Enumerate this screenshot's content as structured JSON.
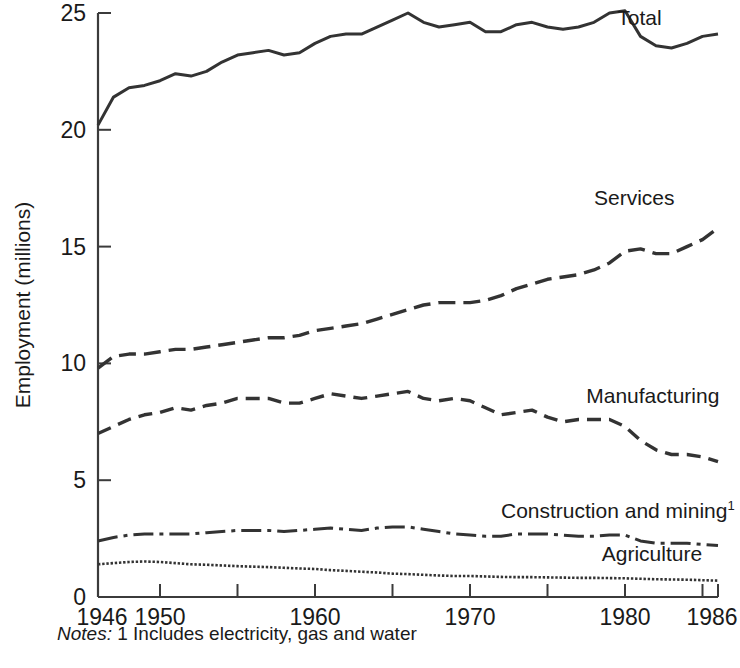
{
  "chart_data": {
    "type": "line",
    "title": "",
    "xlabel": "",
    "ylabel": "Employment (millions)",
    "xlim": [
      1946,
      1986
    ],
    "ylim": [
      0,
      25
    ],
    "grid": false,
    "legend_position": "inline-right-of-lines",
    "y_ticks": [
      "0",
      "5",
      "10",
      "15",
      "20",
      "25"
    ],
    "y_tick_values": [
      0,
      5,
      10,
      15,
      20,
      25
    ],
    "x_ticks": [
      "1946",
      "1950",
      "1960",
      "1970",
      "1980",
      "1986"
    ],
    "x_tick_values": [
      1946,
      1950,
      1960,
      1970,
      1980,
      1986
    ],
    "x_minor_tick_values": [
      1950,
      1955,
      1960,
      1965,
      1970,
      1975,
      1980,
      1985,
      1986
    ],
    "x": [
      1946,
      1947,
      1948,
      1949,
      1950,
      1951,
      1952,
      1953,
      1954,
      1955,
      1956,
      1957,
      1958,
      1959,
      1960,
      1961,
      1962,
      1963,
      1964,
      1965,
      1966,
      1967,
      1968,
      1969,
      1970,
      1971,
      1972,
      1973,
      1974,
      1975,
      1976,
      1977,
      1978,
      1979,
      1980,
      1981,
      1982,
      1983,
      1984,
      1985,
      1986
    ],
    "series": [
      {
        "name": "Total",
        "label": "Total",
        "style": "solid",
        "values": [
          20.2,
          21.4,
          21.8,
          21.9,
          22.1,
          22.4,
          22.3,
          22.5,
          22.9,
          23.2,
          23.3,
          23.4,
          23.2,
          23.3,
          23.7,
          24.0,
          24.1,
          24.1,
          24.4,
          24.7,
          25.0,
          24.6,
          24.4,
          24.5,
          24.6,
          24.2,
          24.2,
          24.5,
          24.6,
          24.4,
          24.3,
          24.4,
          24.6,
          25.0,
          25.1,
          24.0,
          23.6,
          23.5,
          23.7,
          24.0,
          24.1
        ]
      },
      {
        "name": "Services",
        "label": "Services",
        "style": "long-dash",
        "values": [
          9.8,
          10.3,
          10.4,
          10.4,
          10.5,
          10.6,
          10.6,
          10.7,
          10.8,
          10.9,
          11.0,
          11.1,
          11.1,
          11.2,
          11.4,
          11.5,
          11.6,
          11.7,
          11.9,
          12.1,
          12.3,
          12.5,
          12.6,
          12.6,
          12.6,
          12.7,
          12.9,
          13.2,
          13.4,
          13.6,
          13.7,
          13.8,
          14.0,
          14.3,
          14.8,
          14.9,
          14.7,
          14.7,
          15.0,
          15.3,
          15.8
        ]
      },
      {
        "name": "Manufacturing",
        "label": "Manufacturing",
        "style": "dash",
        "values": [
          7.0,
          7.3,
          7.6,
          7.8,
          7.9,
          8.1,
          8.0,
          8.2,
          8.3,
          8.5,
          8.5,
          8.5,
          8.3,
          8.3,
          8.5,
          8.7,
          8.6,
          8.5,
          8.6,
          8.7,
          8.8,
          8.5,
          8.4,
          8.5,
          8.4,
          8.1,
          7.8,
          7.9,
          8.0,
          7.7,
          7.5,
          7.6,
          7.6,
          7.6,
          7.3,
          6.7,
          6.3,
          6.1,
          6.1,
          6.0,
          5.8
        ]
      },
      {
        "name": "Construction and mining",
        "label": "Construction and mining",
        "superscript": "1",
        "style": "dash-dot",
        "values": [
          2.4,
          2.55,
          2.65,
          2.7,
          2.7,
          2.7,
          2.7,
          2.75,
          2.8,
          2.85,
          2.85,
          2.85,
          2.8,
          2.85,
          2.9,
          2.95,
          2.9,
          2.85,
          2.95,
          3.0,
          3.0,
          2.9,
          2.8,
          2.7,
          2.65,
          2.6,
          2.6,
          2.7,
          2.7,
          2.7,
          2.65,
          2.6,
          2.6,
          2.65,
          2.65,
          2.4,
          2.3,
          2.3,
          2.3,
          2.25,
          2.2
        ]
      },
      {
        "name": "Agriculture",
        "label": "Agriculture",
        "style": "dotted",
        "values": [
          1.4,
          1.45,
          1.5,
          1.52,
          1.5,
          1.45,
          1.4,
          1.38,
          1.35,
          1.32,
          1.3,
          1.28,
          1.25,
          1.22,
          1.2,
          1.15,
          1.12,
          1.08,
          1.05,
          1.0,
          0.98,
          0.95,
          0.92,
          0.9,
          0.9,
          0.88,
          0.86,
          0.85,
          0.85,
          0.84,
          0.83,
          0.82,
          0.82,
          0.81,
          0.8,
          0.78,
          0.76,
          0.75,
          0.74,
          0.72,
          0.7
        ]
      }
    ],
    "annotations": [
      {
        "text": "Total",
        "x": 1979.5,
        "y": 24.5
      },
      {
        "text": "Services",
        "x": 1978.0,
        "y": 16.8
      },
      {
        "text": "Manufacturing",
        "x": 1977.5,
        "y": 8.3
      },
      {
        "text": "Construction and mining1",
        "x": 1972.0,
        "y": 3.4
      },
      {
        "text": "Agriculture",
        "x": 1978.5,
        "y": 1.55
      }
    ],
    "notes": {
      "prefix": "Notes:",
      "marker": "1",
      "text": "Includes electricity, gas and water"
    },
    "colors": {
      "line": "#333333",
      "axis": "#3b3b3b",
      "text": "#1a1a1a",
      "background": "#ffffff"
    }
  }
}
